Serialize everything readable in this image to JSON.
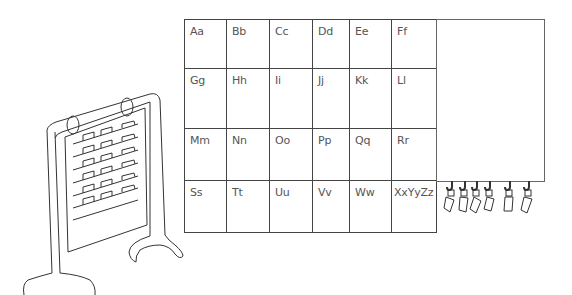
{
  "diagram": {
    "grid": {
      "rows": [
        [
          "Aa",
          "Bb",
          "Cc",
          "Dd",
          "Ee",
          "Ff"
        ],
        [
          "Gg",
          "Hh",
          "Ii",
          "Jj",
          "Kk",
          "Ll"
        ],
        [
          "Mm",
          "Nn",
          "Oo",
          "Pp",
          "Qq",
          "Rr"
        ],
        [
          "Ss",
          "Tt",
          "Uu",
          "Vv",
          "Ww",
          "XxYyZz"
        ]
      ]
    },
    "side_panel": {
      "label": ""
    },
    "hooks": {
      "count": 6
    },
    "easel": {
      "pocket_rows": 6,
      "pockets_per_row": 3
    }
  }
}
